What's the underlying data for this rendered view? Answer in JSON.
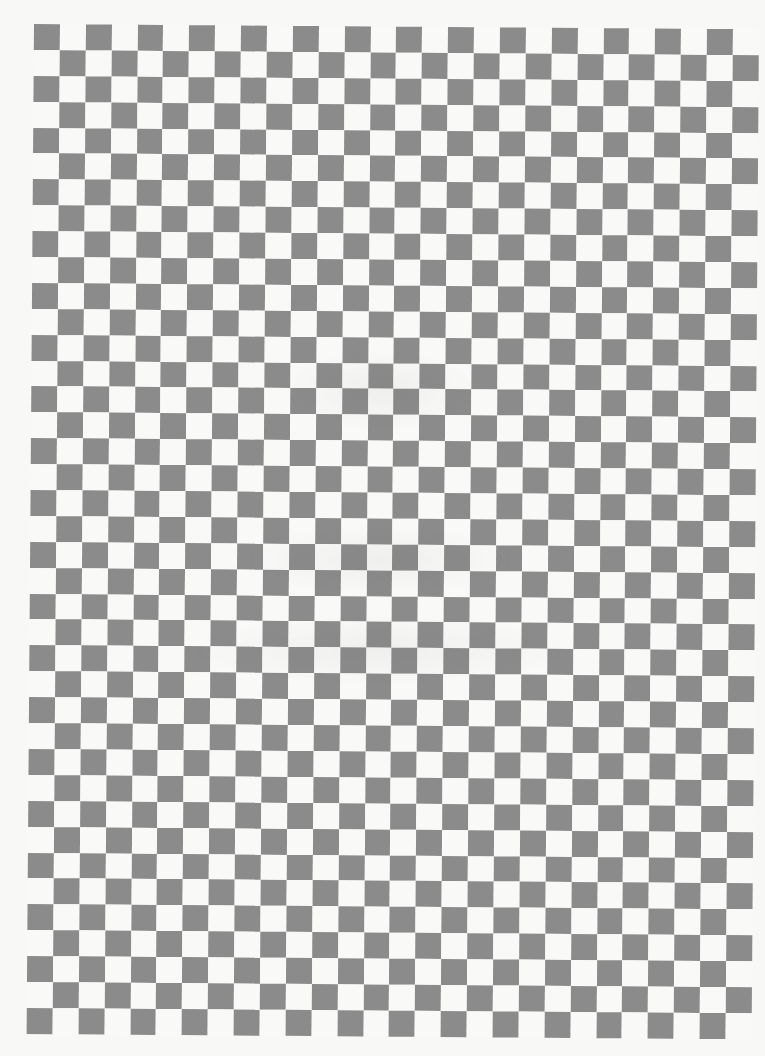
{
  "page": {
    "type": "scanned-checkerboard-pattern",
    "background_color": "#f8f8f6"
  },
  "checkerboard": {
    "columns": 28,
    "rows": 39,
    "cell_size_px": 25.9,
    "origin": {
      "x": 34,
      "y": 24
    },
    "rotation_deg": 0.42,
    "first_cell": "dark",
    "colors": {
      "dark": "#8b8b8b",
      "light": "#f9f9f8"
    }
  }
}
